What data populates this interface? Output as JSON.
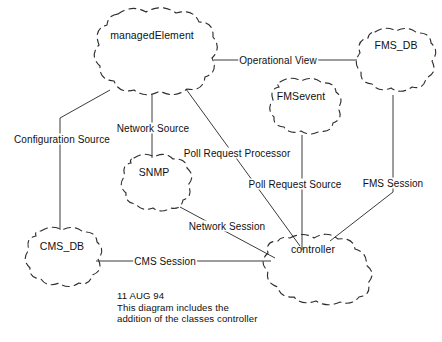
{
  "diagram": {
    "kind": "object-model-cloud-diagram",
    "background_color": "#ffffff",
    "line_color": "#3b3b3b",
    "text_color": "#101010",
    "nodes": [
      {
        "id": "managedElement",
        "label": "managedElement",
        "cx": 152,
        "cy": 52,
        "rx": 63,
        "ry": 43,
        "label_x": 152,
        "label_y": 35
      },
      {
        "id": "fms_db",
        "label": "FMS_DB",
        "cx": 396,
        "cy": 62,
        "rx": 42,
        "ry": 33,
        "label_x": 396,
        "label_y": 45
      },
      {
        "id": "fmsevent",
        "label": "FMSevent",
        "cx": 301,
        "cy": 107,
        "rx": 44,
        "ry": 29,
        "label_x": 301,
        "label_y": 96
      },
      {
        "id": "snmp",
        "label": "SNMP",
        "cx": 154,
        "cy": 185,
        "rx": 41,
        "ry": 30,
        "label_x": 154,
        "label_y": 172
      },
      {
        "id": "cms_db",
        "label": "CMS_DB",
        "cx": 62,
        "cy": 259,
        "rx": 43,
        "ry": 31,
        "label_x": 62,
        "label_y": 246
      },
      {
        "id": "controller",
        "label": "controller",
        "cx": 320,
        "cy": 267,
        "rx": 55,
        "ry": 32,
        "label_x": 313,
        "label_y": 249
      }
    ],
    "edges": [
      {
        "id": "operational-view",
        "label": "Operational View",
        "from": "managedElement",
        "to": "fms_db",
        "label_x": 278,
        "label_y": 60
      },
      {
        "id": "configuration-source",
        "label": "Configuration Source",
        "from": "managedElement",
        "to": "cms_db",
        "label_x": 62,
        "label_y": 139
      },
      {
        "id": "network-source",
        "label": "Network Source",
        "from": "managedElement",
        "to": "snmp",
        "label_x": 153,
        "label_y": 128
      },
      {
        "id": "poll-request-processor",
        "label": "Poll Request Processor",
        "from": "managedElement",
        "to": "controller",
        "label_x": 237,
        "label_y": 153
      },
      {
        "id": "poll-request-source",
        "label": "Poll Request Source",
        "from": "fmsevent",
        "to": "controller",
        "label_x": 295,
        "label_y": 184
      },
      {
        "id": "fms-session",
        "label": "FMS Session",
        "from": "fms_db",
        "to": "controller",
        "label_x": 393,
        "label_y": 183
      },
      {
        "id": "network-session",
        "label": "Network Session",
        "from": "snmp",
        "to": "controller",
        "label_x": 227,
        "label_y": 226
      },
      {
        "id": "cms-session",
        "label": "CMS Session",
        "from": "cms_db",
        "to": "controller",
        "label_x": 165,
        "label_y": 261
      }
    ],
    "note": {
      "line1": "11 AUG 94",
      "line2": "This diagram includes the",
      "line3": "addition of the classes controller"
    }
  }
}
